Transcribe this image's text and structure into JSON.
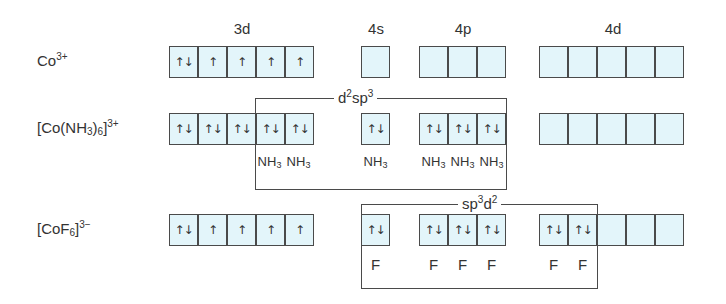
{
  "shell_headers": [
    {
      "label": "3d",
      "x": 222
    },
    {
      "label": "4s",
      "x": 356
    },
    {
      "label": "4p",
      "x": 443
    },
    {
      "label": "4d",
      "x": 593
    }
  ],
  "rows": [
    {
      "species_html": "Co<sup>3+</sup>",
      "species_text": "Co3+",
      "y": 46,
      "orbitals": {
        "3d": [
          "↿⇂",
          "↿",
          "↿",
          "↿",
          "↿"
        ],
        "4s": [
          ""
        ],
        "4p": [
          "",
          "",
          ""
        ],
        "4d": [
          "",
          "",
          "",
          "",
          ""
        ]
      },
      "ligands": []
    },
    {
      "species_html": "[Co(NH<sub>3</sub>)<sub>6</sub>]<sup>3+</sup>",
      "species_text": "[Co(NH3)6]3+",
      "y": 113,
      "orbitals": {
        "3d": [
          "↿⇂",
          "↿⇂",
          "↿⇂",
          "↿⇂",
          "↿⇂"
        ],
        "4s": [
          "↿⇂"
        ],
        "4p": [
          "↿⇂",
          "↿⇂",
          "↿⇂"
        ],
        "4d": [
          "",
          "",
          "",
          "",
          ""
        ]
      },
      "hybridization": {
        "label_html": "d<sup>2</sup>sp<sup>3</sup>",
        "label_text": "d2sp3"
      },
      "ligands": [
        "NH3",
        "NH3",
        "NH3",
        "NH3",
        "NH3",
        "NH3"
      ]
    },
    {
      "species_html": "[CoF<sub>6</sub>]<sup>3−</sup>",
      "species_text": "[CoF6]3−",
      "y": 214,
      "orbitals": {
        "3d": [
          "↿⇂",
          "↿",
          "↿",
          "↿",
          "↿"
        ],
        "4s": [
          "↿⇂"
        ],
        "4p": [
          "↿⇂",
          "↿⇂",
          "↿⇂"
        ],
        "4d": [
          "↿⇂",
          "↿⇂",
          "",
          "",
          ""
        ]
      },
      "hybridization": {
        "label_html": "sp<sup>3</sup>d<sup>2</sup>",
        "label_text": "sp3d2"
      },
      "ligands": [
        "F",
        "F",
        "F",
        "F",
        "F",
        "F"
      ]
    }
  ],
  "colors": {
    "orbital_fill": "#e3f5fa",
    "border": "#4a4a4a",
    "text": "#333333"
  }
}
